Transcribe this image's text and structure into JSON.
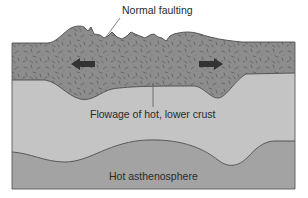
{
  "diagram": {
    "labels": {
      "normal_faulting": "Normal faulting",
      "flowage": "Flowage of hot, lower crust",
      "asthenosphere": "Hot asthenosphere"
    },
    "layers": [
      {
        "name": "upper-crust",
        "fill": "#8d8d8d",
        "texture": "speckled"
      },
      {
        "name": "lower-crust",
        "fill": "#c4c4c4"
      },
      {
        "name": "asthenosphere",
        "fill": "#a3a3a3"
      }
    ],
    "arrows": [
      {
        "name": "extension-arrow-left",
        "direction": "left",
        "color": "#333333"
      },
      {
        "name": "extension-arrow-right",
        "direction": "right",
        "color": "#333333"
      }
    ],
    "colors": {
      "outline": "#4a4a4a",
      "upper_crust": "#8d8d8d",
      "lower_crust": "#c4c4c4",
      "asthenosphere": "#a3a3a3",
      "speckle": "#5e5e5e",
      "arrow": "#333333",
      "text": "#2a2a2a"
    }
  }
}
